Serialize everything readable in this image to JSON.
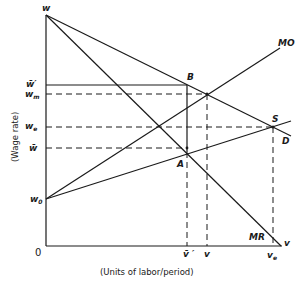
{
  "diagram": {
    "y_axis_title": "(Wage rate)",
    "x_axis_title": "(Units of labor/period)",
    "origin_label": "0",
    "y_labels": {
      "w": "w",
      "w_bar_prime": "w̄′",
      "w_m": "w",
      "w_m_sub": "m",
      "w_e": "w",
      "w_e_sub": "e",
      "w_bar": "w̄",
      "w_0": "w",
      "w_0_sub": "0"
    },
    "x_labels": {
      "v_prime": "v̄ ′",
      "v": "v",
      "v_e": "v",
      "v_e_sub": "e"
    },
    "curve_labels": {
      "MO": "MO",
      "D": "D",
      "MR": "MR",
      "v_end": "v"
    },
    "point_labels": {
      "B": "B",
      "S": "S",
      "A": "A"
    }
  }
}
